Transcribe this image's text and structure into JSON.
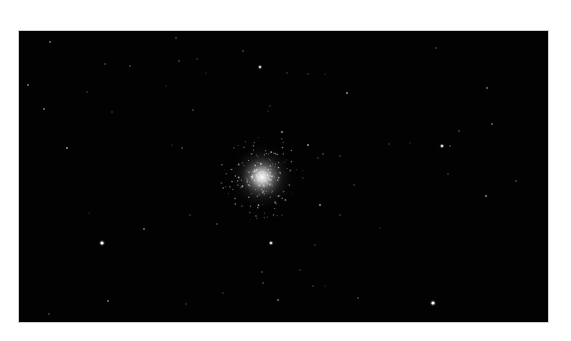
{
  "image": {
    "subject": "globular star cluster",
    "background_color": "#020202",
    "frame_color": "#cfcfcf",
    "page_color": "#ffffff",
    "frame": {
      "x": 19,
      "y": 31,
      "width": 529,
      "height": 291
    },
    "cluster": {
      "cx": 262,
      "cy": 177,
      "core_radius": 9,
      "halo_radius": 34,
      "core_color": "#e6e6e6"
    },
    "stars": [
      {
        "x": 102,
        "y": 243,
        "r": 1.6,
        "b": 1.0
      },
      {
        "x": 433,
        "y": 303,
        "r": 1.6,
        "b": 1.0
      },
      {
        "x": 442,
        "y": 146,
        "r": 1.3,
        "b": 0.85
      },
      {
        "x": 271,
        "y": 243,
        "r": 1.3,
        "b": 0.85
      },
      {
        "x": 260,
        "y": 67,
        "r": 1.2,
        "b": 0.8
      },
      {
        "x": 347,
        "y": 93,
        "r": 1.0,
        "b": 0.6
      },
      {
        "x": 282,
        "y": 132,
        "r": 1.0,
        "b": 0.6
      },
      {
        "x": 308,
        "y": 145,
        "r": 1.0,
        "b": 0.6
      },
      {
        "x": 320,
        "y": 205,
        "r": 1.0,
        "b": 0.6
      },
      {
        "x": 486,
        "y": 196,
        "r": 1.0,
        "b": 0.55
      },
      {
        "x": 487,
        "y": 88,
        "r": 0.9,
        "b": 0.5
      },
      {
        "x": 492,
        "y": 124,
        "r": 0.9,
        "b": 0.45
      },
      {
        "x": 459,
        "y": 131,
        "r": 0.8,
        "b": 0.4
      },
      {
        "x": 516,
        "y": 181,
        "r": 0.8,
        "b": 0.4
      },
      {
        "x": 436,
        "y": 48,
        "r": 0.8,
        "b": 0.35
      },
      {
        "x": 450,
        "y": 146,
        "r": 0.8,
        "b": 0.4
      },
      {
        "x": 448,
        "y": 174,
        "r": 0.7,
        "b": 0.35
      },
      {
        "x": 50,
        "y": 42,
        "r": 0.9,
        "b": 0.5
      },
      {
        "x": 28,
        "y": 85,
        "r": 0.9,
        "b": 0.5
      },
      {
        "x": 44,
        "y": 109,
        "r": 0.9,
        "b": 0.5
      },
      {
        "x": 67,
        "y": 148,
        "r": 1.0,
        "b": 0.6
      },
      {
        "x": 105,
        "y": 64,
        "r": 0.8,
        "b": 0.35
      },
      {
        "x": 130,
        "y": 66,
        "r": 0.8,
        "b": 0.4
      },
      {
        "x": 87,
        "y": 92,
        "r": 0.7,
        "b": 0.3
      },
      {
        "x": 112,
        "y": 112,
        "r": 0.7,
        "b": 0.3
      },
      {
        "x": 144,
        "y": 229,
        "r": 0.9,
        "b": 0.5
      },
      {
        "x": 217,
        "y": 224,
        "r": 0.8,
        "b": 0.4
      },
      {
        "x": 190,
        "y": 215,
        "r": 0.7,
        "b": 0.3
      },
      {
        "x": 262,
        "y": 272,
        "r": 0.8,
        "b": 0.45
      },
      {
        "x": 263,
        "y": 283,
        "r": 0.8,
        "b": 0.4
      },
      {
        "x": 223,
        "y": 293,
        "r": 0.7,
        "b": 0.3
      },
      {
        "x": 186,
        "y": 304,
        "r": 0.7,
        "b": 0.3
      },
      {
        "x": 278,
        "y": 300,
        "r": 0.9,
        "b": 0.5
      },
      {
        "x": 108,
        "y": 301,
        "r": 0.9,
        "b": 0.5
      },
      {
        "x": 49,
        "y": 314,
        "r": 0.8,
        "b": 0.4
      },
      {
        "x": 89,
        "y": 213,
        "r": 0.6,
        "b": 0.25
      },
      {
        "x": 243,
        "y": 51,
        "r": 0.8,
        "b": 0.4
      },
      {
        "x": 287,
        "y": 73,
        "r": 0.7,
        "b": 0.3
      },
      {
        "x": 308,
        "y": 74,
        "r": 0.7,
        "b": 0.3
      },
      {
        "x": 325,
        "y": 74,
        "r": 0.6,
        "b": 0.25
      },
      {
        "x": 270,
        "y": 106,
        "r": 0.7,
        "b": 0.3
      },
      {
        "x": 268,
        "y": 111,
        "r": 0.6,
        "b": 0.3
      },
      {
        "x": 323,
        "y": 154,
        "r": 0.8,
        "b": 0.4
      },
      {
        "x": 340,
        "y": 156,
        "r": 0.7,
        "b": 0.35
      },
      {
        "x": 354,
        "y": 185,
        "r": 0.7,
        "b": 0.35
      },
      {
        "x": 318,
        "y": 158,
        "r": 0.7,
        "b": 0.35
      },
      {
        "x": 389,
        "y": 144,
        "r": 0.7,
        "b": 0.3
      },
      {
        "x": 410,
        "y": 143,
        "r": 0.6,
        "b": 0.25
      },
      {
        "x": 340,
        "y": 215,
        "r": 0.7,
        "b": 0.35
      },
      {
        "x": 300,
        "y": 270,
        "r": 0.7,
        "b": 0.3
      },
      {
        "x": 315,
        "y": 245,
        "r": 0.7,
        "b": 0.3
      },
      {
        "x": 358,
        "y": 298,
        "r": 0.8,
        "b": 0.4
      },
      {
        "x": 313,
        "y": 286,
        "r": 0.7,
        "b": 0.3
      },
      {
        "x": 325,
        "y": 286,
        "r": 0.6,
        "b": 0.25
      },
      {
        "x": 380,
        "y": 228,
        "r": 0.6,
        "b": 0.25
      },
      {
        "x": 176,
        "y": 38,
        "r": 0.8,
        "b": 0.4
      },
      {
        "x": 179,
        "y": 61,
        "r": 0.8,
        "b": 0.4
      },
      {
        "x": 197,
        "y": 59,
        "r": 0.7,
        "b": 0.3
      },
      {
        "x": 193,
        "y": 110,
        "r": 0.8,
        "b": 0.4
      },
      {
        "x": 206,
        "y": 73,
        "r": 0.6,
        "b": 0.25
      },
      {
        "x": 182,
        "y": 148,
        "r": 0.8,
        "b": 0.4
      },
      {
        "x": 172,
        "y": 145,
        "r": 0.6,
        "b": 0.25
      },
      {
        "x": 234,
        "y": 148,
        "r": 0.7,
        "b": 0.35
      },
      {
        "x": 166,
        "y": 86,
        "r": 0.6,
        "b": 0.25
      }
    ]
  }
}
